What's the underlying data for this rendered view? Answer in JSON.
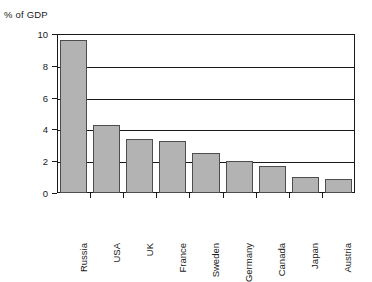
{
  "chart_data": {
    "type": "bar",
    "title": "% of GDP",
    "xlabel": "",
    "ylabel": "% of GDP",
    "ylim": [
      0,
      10
    ],
    "yticks": [
      0,
      2,
      4,
      6,
      8,
      10
    ],
    "grid": true,
    "legend": false,
    "orientation": "vertical",
    "bar_color": "#b3b3b3",
    "bar_edge_color": "#4d4d4d",
    "axis_color": "#1a1a1a",
    "categories": [
      "Russia",
      "USA",
      "UK",
      "France",
      "Sweden",
      "Germany",
      "Canada",
      "Japan",
      "Austria"
    ],
    "values": [
      9.6,
      4.3,
      3.4,
      3.3,
      2.5,
      2.0,
      1.7,
      1.0,
      0.9
    ],
    "series": [
      {
        "name": "% of GDP",
        "values": [
          9.6,
          4.3,
          3.4,
          3.3,
          2.5,
          2.0,
          1.7,
          1.0,
          0.9
        ]
      }
    ],
    "ytick_labels": [
      "0",
      "2",
      "4",
      "6",
      "8",
      "10"
    ]
  }
}
